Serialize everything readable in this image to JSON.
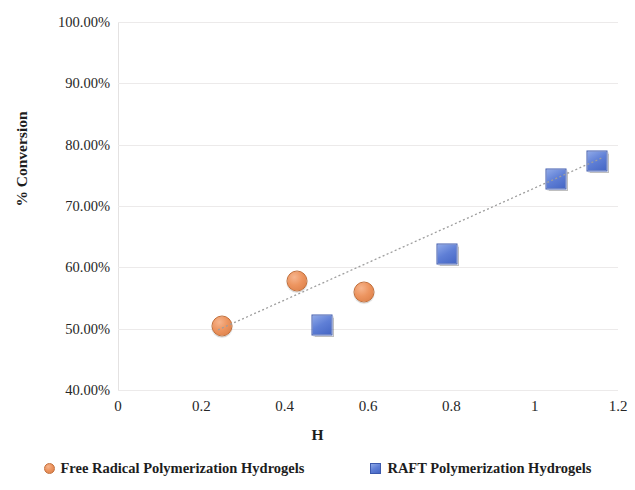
{
  "chart_data": {
    "type": "scatter",
    "title": "",
    "xlabel": "H",
    "ylabel": "% Conversion",
    "xlim": [
      0,
      1.2
    ],
    "ylim": [
      40,
      100
    ],
    "grid": true,
    "legend_position": "bottom",
    "x_ticks": [
      "0",
      "0.2",
      "0.4",
      "0.6",
      "0.8",
      "1",
      "1.2"
    ],
    "x_tick_values": [
      0,
      0.2,
      0.4,
      0.6,
      0.8,
      1.0,
      1.2
    ],
    "y_ticks": [
      "40.00%",
      "50.00%",
      "60.00%",
      "70.00%",
      "80.00%",
      "90.00%",
      "100.00%"
    ],
    "y_tick_values": [
      40,
      50,
      60,
      70,
      80,
      90,
      100
    ],
    "series": [
      {
        "name": "Free Radical Polymerization Hydrogels",
        "marker": "circle",
        "color": "#ED9560",
        "points": [
          {
            "x": 0.25,
            "y": 50.4
          },
          {
            "x": 0.43,
            "y": 57.7
          },
          {
            "x": 0.59,
            "y": 55.9
          }
        ]
      },
      {
        "name": "RAFT Polymerization Hydrogels",
        "marker": "square",
        "color": "#5F7FD6",
        "points": [
          {
            "x": 0.49,
            "y": 50.6
          },
          {
            "x": 0.79,
            "y": 62.1
          },
          {
            "x": 1.05,
            "y": 74.4
          },
          {
            "x": 1.15,
            "y": 77.4
          }
        ]
      }
    ],
    "trendline": {
      "style": "dotted",
      "color": "#9e9e9e",
      "x_start": 0.24,
      "y_start": 49.8,
      "x_end": 1.16,
      "y_end": 77.8
    }
  },
  "legend": {
    "items": [
      {
        "label": "Free Radical Polymerization Hydrogels",
        "marker": "circle"
      },
      {
        "label": "RAFT Polymerization Hydrogels",
        "marker": "square"
      }
    ]
  }
}
